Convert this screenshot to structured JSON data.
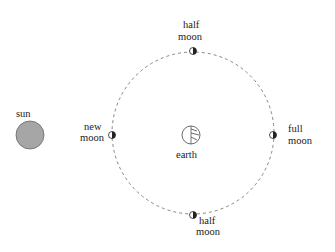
{
  "diagram": {
    "sun": {
      "label": "sun",
      "fill": "#a6a6a6"
    },
    "earth": {
      "label": "earth"
    },
    "orbit": {
      "style": "dashed",
      "color": "#777777"
    },
    "moons": [
      {
        "id": "top",
        "label_line1": "half",
        "label_line2": "moon"
      },
      {
        "id": "left",
        "label_line1": "new",
        "label_line2": "moon"
      },
      {
        "id": "right",
        "label_line1": "full",
        "label_line2": "moon"
      },
      {
        "id": "bottom",
        "label_line1": "half",
        "label_line2": "moon"
      }
    ]
  }
}
